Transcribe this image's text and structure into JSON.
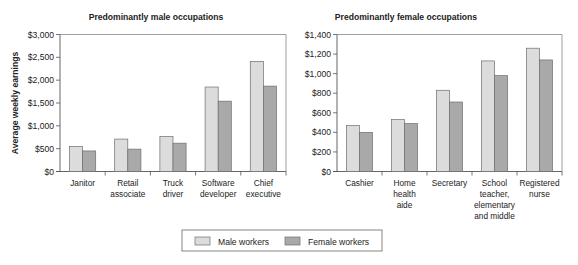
{
  "chart_data": [
    {
      "type": "bar",
      "title": "Predominantly male occupations",
      "xlabel": "",
      "ylabel": "Average weekly earnings",
      "ylim": [
        0,
        3000
      ],
      "yticks": [
        0,
        500,
        1000,
        1500,
        2000,
        2500,
        3000
      ],
      "ytick_labels": [
        "$0",
        "$500",
        "$1,000",
        "$1,500",
        "$2,000",
        "$2,500",
        "$3,000"
      ],
      "grid": false,
      "categories": [
        "Janitor",
        "Retail associate",
        "Truck driver",
        "Software developer",
        "Chief executive"
      ],
      "category_lines": [
        [
          "Janitor"
        ],
        [
          "Retail",
          "associate"
        ],
        [
          "Truck",
          "driver"
        ],
        [
          "Software",
          "developer"
        ],
        [
          "Chief",
          "executive"
        ]
      ],
      "series": [
        {
          "name": "Male workers",
          "values": [
            550,
            710,
            770,
            1850,
            2410
          ]
        },
        {
          "name": "Female workers",
          "values": [
            450,
            490,
            620,
            1540,
            1870
          ]
        }
      ]
    },
    {
      "type": "bar",
      "title": "Predominantly female occupations",
      "xlabel": "",
      "ylabel": "",
      "ylim": [
        0,
        1400
      ],
      "yticks": [
        0,
        200,
        400,
        600,
        800,
        1000,
        1200,
        1400
      ],
      "ytick_labels": [
        "$0",
        "$200",
        "$400",
        "$600",
        "$800",
        "$1,000",
        "$1,200",
        "$1,400"
      ],
      "grid": false,
      "categories": [
        "Cashier",
        "Home health aide",
        "Secretary",
        "School teacher, elementary and middle",
        "Registered nurse"
      ],
      "category_lines": [
        [
          "Cashier"
        ],
        [
          "Home",
          "health",
          "aide"
        ],
        [
          "Secretary"
        ],
        [
          "School",
          "teacher,",
          "elementary",
          "and middle"
        ],
        [
          "Registered",
          "nurse"
        ]
      ],
      "series": [
        {
          "name": "Male workers",
          "values": [
            470,
            530,
            830,
            1130,
            1260
          ]
        },
        {
          "name": "Female workers",
          "values": [
            400,
            490,
            710,
            980,
            1140
          ]
        }
      ]
    }
  ],
  "legend": {
    "position": "bottom-center",
    "items": [
      {
        "label": "Male workers",
        "color": "#dcdcdc"
      },
      {
        "label": "Female workers",
        "color": "#a9a9a9"
      }
    ]
  },
  "colors": {
    "male": "#dcdcdc",
    "female": "#a9a9a9",
    "bar_outline": "#6e6e6e",
    "axis": "#555555",
    "frame": "#888888"
  }
}
